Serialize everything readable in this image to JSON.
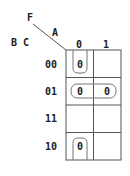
{
  "kmap": {
    "function_label": "F",
    "col_var_label": "A",
    "row_var_label": "B C",
    "col_headers": [
      "0",
      "1"
    ],
    "row_headers": [
      "00",
      "01",
      "11",
      "10"
    ],
    "cells": [
      [
        "0",
        ""
      ],
      [
        "0",
        "0"
      ],
      [
        "",
        ""
      ],
      [
        "0",
        ""
      ]
    ],
    "groupings": [
      {
        "name": "group-vertical-wrap-col0",
        "cells": [
          [
            0,
            0
          ],
          [
            3,
            0
          ]
        ],
        "note": "wraps top/bottom edges"
      },
      {
        "name": "group-row-01",
        "cells": [
          [
            1,
            0
          ],
          [
            1,
            1
          ]
        ]
      }
    ],
    "line_color": "#555555",
    "group_color": "#777777"
  }
}
